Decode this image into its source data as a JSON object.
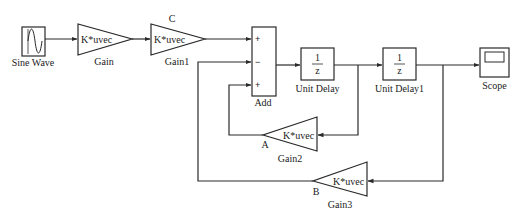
{
  "diagram": {
    "type": "simulink-block-diagram",
    "blocks": {
      "sine": {
        "name": "Sine Wave"
      },
      "gain": {
        "name": "Gain",
        "param": "K*uvec"
      },
      "gain1": {
        "name": "Gain1",
        "param": "K*uvec",
        "marker": "C"
      },
      "add": {
        "name": "Add",
        "signs": [
          "+",
          "−",
          "+"
        ]
      },
      "delay": {
        "name": "Unit Delay",
        "num": "1",
        "den": "z"
      },
      "delay1": {
        "name": "Unit Delay1",
        "num": "1",
        "den": "z"
      },
      "scope": {
        "name": "Scope"
      },
      "gain2": {
        "name": "Gain2",
        "param": "K*uvec",
        "marker": "A"
      },
      "gain3": {
        "name": "Gain3",
        "param": "K*uvec",
        "marker": "B"
      }
    },
    "connections": [
      [
        "Sine Wave",
        "Gain"
      ],
      [
        "Gain",
        "Gain1"
      ],
      [
        "Gain1",
        "Add.in1(+)"
      ],
      [
        "Add",
        "Unit Delay"
      ],
      [
        "Unit Delay",
        "Unit Delay1"
      ],
      [
        "Unit Delay",
        "Gain2"
      ],
      [
        "Gain2",
        "Add.in3(+)"
      ],
      [
        "Unit Delay1",
        "Scope"
      ],
      [
        "Unit Delay1",
        "Gain3"
      ],
      [
        "Gain3",
        "Add.in2(-)"
      ]
    ]
  }
}
